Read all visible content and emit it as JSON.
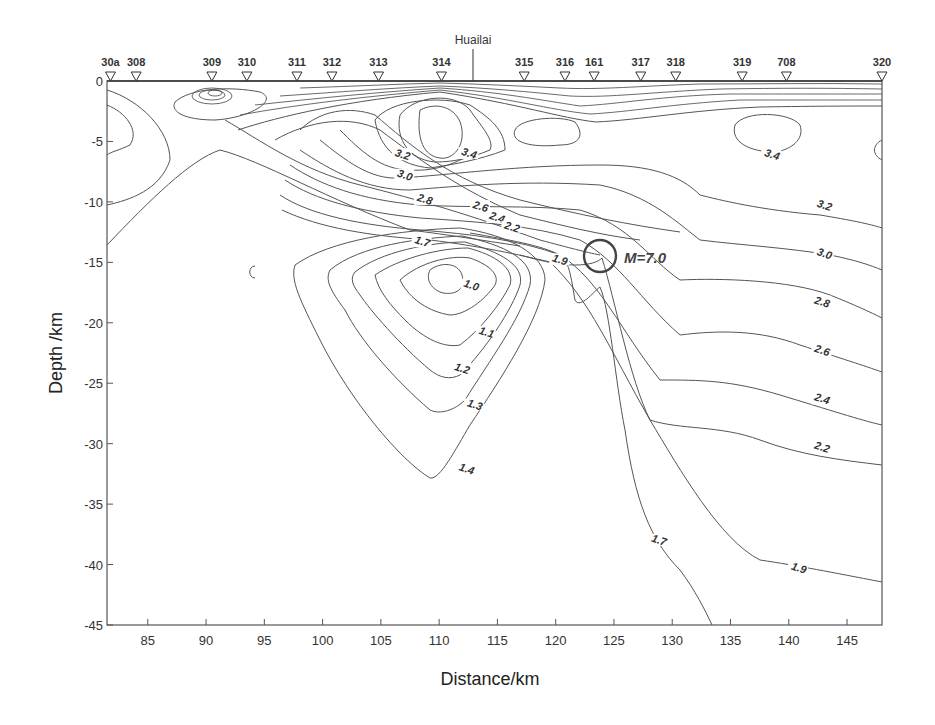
{
  "chart_data": {
    "type": "contour",
    "title": "",
    "xlabel": "Distance/km",
    "ylabel": "Depth /km",
    "xlim": [
      81.5,
      148
    ],
    "ylim": [
      -45,
      0
    ],
    "x_ticks": [
      85,
      90,
      95,
      100,
      105,
      110,
      115,
      120,
      125,
      130,
      135,
      140,
      145
    ],
    "y_ticks": [
      0,
      -5,
      -10,
      -15,
      -20,
      -25,
      -30,
      -35,
      -40,
      -45
    ],
    "x_tick_labels": [
      "85",
      "90",
      "95",
      "100",
      "105",
      "110",
      "115",
      "120",
      "125",
      "130",
      "135",
      "140",
      "145"
    ],
    "y_tick_labels": [
      "0",
      "-5",
      "-10",
      "-15",
      "-20",
      "-25",
      "-30",
      "-35",
      "-40",
      "-45"
    ],
    "grid": false,
    "stations": [
      {
        "name": "30a",
        "x": 81.8
      },
      {
        "name": "308",
        "x": 84.0
      },
      {
        "name": "309",
        "x": 90.5
      },
      {
        "name": "310",
        "x": 93.5
      },
      {
        "name": "311",
        "x": 97.8
      },
      {
        "name": "312",
        "x": 100.8
      },
      {
        "name": "313",
        "x": 104.8
      },
      {
        "name": "314",
        "x": 110.2
      },
      {
        "name": "315",
        "x": 117.3
      },
      {
        "name": "316",
        "x": 120.8
      },
      {
        "name": "161",
        "x": 123.3
      },
      {
        "name": "317",
        "x": 127.3
      },
      {
        "name": "318",
        "x": 130.3
      },
      {
        "name": "319",
        "x": 136.0
      },
      {
        "name": "708",
        "x": 139.8
      },
      {
        "name": "320",
        "x": 148.0
      }
    ],
    "marker_line": {
      "label": "Huailai",
      "x": 113.2
    },
    "earthquake": {
      "label": "M=7.0",
      "x": 124.0,
      "y": -14.5
    },
    "contour_levels": [
      1.0,
      1.1,
      1.2,
      1.3,
      1.4,
      1.7,
      1.9,
      2.2,
      2.4,
      2.6,
      2.8,
      3.0,
      3.2,
      3.4
    ],
    "contour_labels": [
      {
        "text": "3.4",
        "x": 112.5,
        "y": -6.2
      },
      {
        "text": "3.2",
        "x": 106.8,
        "y": -6.3
      },
      {
        "text": "3.0",
        "x": 107.0,
        "y": -8.0
      },
      {
        "text": "2.8",
        "x": 108.7,
        "y": -10.0
      },
      {
        "text": "2.6",
        "x": 113.5,
        "y": -10.6
      },
      {
        "text": "2.4",
        "x": 114.9,
        "y": -11.5
      },
      {
        "text": "2.2",
        "x": 116.2,
        "y": -12.3
      },
      {
        "text": "1.7",
        "x": 108.5,
        "y": -13.5
      },
      {
        "text": "1.9",
        "x": 120.3,
        "y": -15.0
      },
      {
        "text": "1.0",
        "x": 112.7,
        "y": -17.1
      },
      {
        "text": "1.1",
        "x": 114.0,
        "y": -21.0
      },
      {
        "text": "1.2",
        "x": 111.9,
        "y": -24.0
      },
      {
        "text": "1.3",
        "x": 113.0,
        "y": -27.0
      },
      {
        "text": "1.4",
        "x": 112.3,
        "y": -32.3
      },
      {
        "text": "3.4",
        "x": 138.5,
        "y": -6.3
      },
      {
        "text": "3.2",
        "x": 143.0,
        "y": -10.5
      },
      {
        "text": "3.0",
        "x": 143.0,
        "y": -14.5
      },
      {
        "text": "2.8",
        "x": 142.8,
        "y": -18.5
      },
      {
        "text": "2.6",
        "x": 142.8,
        "y": -22.5
      },
      {
        "text": "2.4",
        "x": 142.8,
        "y": -26.5
      },
      {
        "text": "2.2",
        "x": 142.8,
        "y": -30.5
      },
      {
        "text": "1.9",
        "x": 140.8,
        "y": -40.5
      },
      {
        "text": "1.7",
        "x": 128.8,
        "y": -38.2
      }
    ],
    "annotations": [
      "Huailai",
      "M=7.0"
    ]
  }
}
